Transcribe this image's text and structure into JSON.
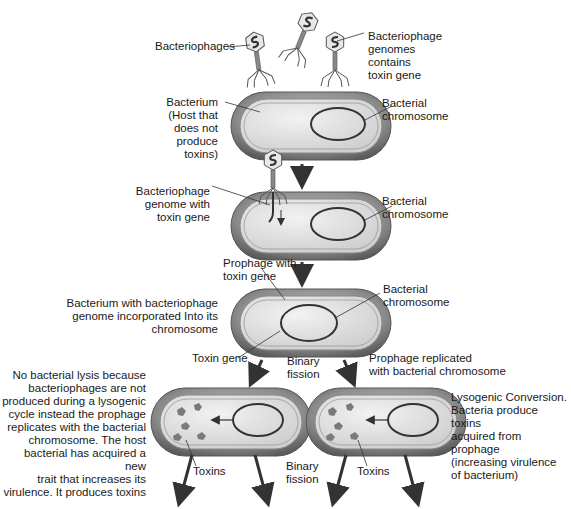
{
  "diagram": {
    "labels": {
      "bacteriophages": "Bacteriophages",
      "phage_genomes": "Bacteriophage\ngenomes\ncontains\ntoxin gene",
      "bacterium_host": "Bacterium\n(Host that\ndoes not\nproduce\ntoxins)",
      "bacterial_chromosome_1": "Bacterial\nchromosome",
      "phage_genome_toxin": "Bacteriophage\ngenome with\ntoxin gene",
      "bacterial_chromosome_2": "Bacterial\nchromosome",
      "prophage_toxin": "Prophage with\ntoxin gene",
      "bacterial_chromosome_3": "Bacterial\nchromosome",
      "bacterium_incorporated": "Bacterium with bacteriophage\ngenome incorporated Into its\nchromosome",
      "toxin_gene": "Toxin gene",
      "binary_fission_1": "Binary\nfission",
      "prophage_replicated": "Prophage replicated\nwith bacterial chromosome",
      "no_lysis_note": "No bacterial lysis because\nbacteriophages are not\nproduced during a lysogenic\ncycle instead the prophage\nreplicates with the bacterial\nchromosome. The host\nbacterial has acquired a new\ntrait that increases its\nvirulence. It produces toxins",
      "toxins_left": "Toxins",
      "binary_fission_2": "Binary\nfission",
      "toxins_right": "Toxins",
      "lysogenic_conversion": "Lysogenic Conversion.\nBacteria produce toxins\nacquired from prophage\n(increasing virulence\nof bacterium)"
    },
    "colors": {
      "cell_outer": "#8a8a8a",
      "cell_inner": "#dcdcdc",
      "chromosome": "#333333",
      "toxin": "#7a7a7a",
      "arrow": "#333333"
    }
  }
}
